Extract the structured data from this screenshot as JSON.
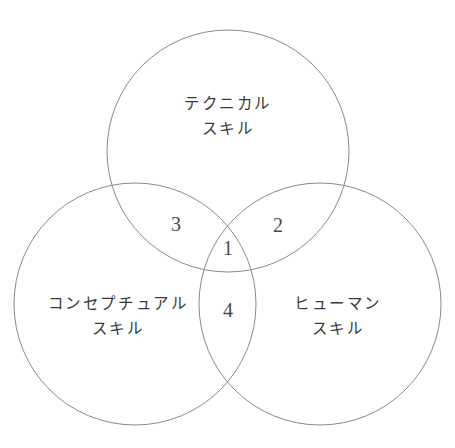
{
  "diagram": {
    "type": "venn",
    "background_color": "#ffffff",
    "stroke_color": "#8a8a8a",
    "text_color": "#3a3a3a",
    "number_color": "#4a4a4a",
    "circles": [
      {
        "id": "technical",
        "position": "top",
        "cx": 228,
        "cy": 151,
        "r": 121,
        "label_line1": "テクニカル",
        "label_line2": "スキル",
        "label_x": 228,
        "label_y": 117
      },
      {
        "id": "conceptual",
        "position": "bottom-left",
        "cx": 135,
        "cy": 304,
        "r": 121,
        "label_line1": "コンセプチュアル",
        "label_line2": "スキル",
        "label_x": 118,
        "label_y": 317
      },
      {
        "id": "human",
        "position": "bottom-right",
        "cx": 320,
        "cy": 304,
        "r": 121,
        "label_line1": "ヒューマン",
        "label_line2": "スキル",
        "label_x": 338,
        "label_y": 317
      }
    ],
    "regions": [
      {
        "id": "center-all-three",
        "number": "1",
        "x": 228,
        "y": 248
      },
      {
        "id": "technical-human",
        "number": "2",
        "x": 278,
        "y": 225
      },
      {
        "id": "technical-conceptual",
        "number": "3",
        "x": 176,
        "y": 224
      },
      {
        "id": "conceptual-human",
        "number": "4",
        "x": 228,
        "y": 310
      }
    ]
  }
}
